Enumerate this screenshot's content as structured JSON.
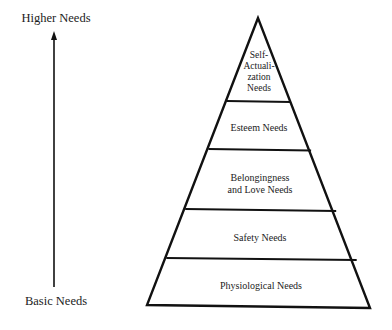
{
  "axis": {
    "top_label": "Higher Needs",
    "bottom_label": "Basic Needs",
    "direction": "upward"
  },
  "pyramid": {
    "title": "Maslow's Hierarchy of Needs",
    "tiers": [
      {
        "level": 5,
        "label": "Self-\nActuali-\nzation\nNeeds",
        "lines": [
          "Self-",
          "Actuali-",
          "zation",
          "Needs"
        ]
      },
      {
        "level": 4,
        "label": "Esteem Needs",
        "lines": [
          "Esteem Needs"
        ]
      },
      {
        "level": 3,
        "label": "Belongingness and Love Needs",
        "lines": [
          "Belongingness",
          "and Love Needs"
        ]
      },
      {
        "level": 2,
        "label": "Safety Needs",
        "lines": [
          "Safety Needs"
        ]
      },
      {
        "level": 1,
        "label": "Physiological Needs",
        "lines": [
          "Physiological Needs"
        ]
      }
    ]
  },
  "colors": {
    "stroke": "#111111",
    "text": "#1c1c1c",
    "background": "#ffffff"
  }
}
